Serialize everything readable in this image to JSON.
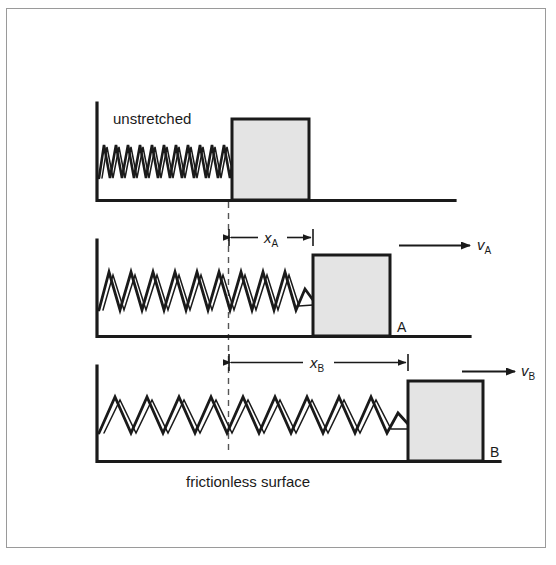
{
  "figure": {
    "kind": "physics-diagram",
    "background_color": "#ffffff",
    "frame_color": "#9a9a9a",
    "ink_color": "#1a1a1a",
    "block_fill_color": "#e4e4e4",
    "block_border_color": "#1a1a1a"
  },
  "labels": {
    "unstretched": "unstretched",
    "frictionless_surface": "frictionless surface",
    "block_a": "A",
    "block_b": "B",
    "x_a_symbol": "x",
    "x_a_subscript": "A",
    "x_b_symbol": "x",
    "x_b_subscript": "B",
    "v_a_symbol": "v",
    "v_a_subscript": "A",
    "v_b_symbol": "v",
    "v_b_subscript": "B"
  },
  "panels": [
    {
      "id": "panel-unstretched",
      "caption": "unstretched",
      "wall_x": 96,
      "ground_y": 202,
      "ground_right_x": 455,
      "spring_coils": 11,
      "spring_left_x": 100,
      "spring_right_x": 232,
      "block_left_x": 232,
      "block_right_x": 309,
      "block_top_y": 119,
      "block_bottom_y": 200,
      "block_label": "",
      "has_velocity_arrow": false,
      "has_dimension": false
    },
    {
      "id": "panel-a",
      "caption": "A",
      "wall_x": 96,
      "ground_y": 338,
      "ground_right_x": 470,
      "spring_coils": 10,
      "spring_left_x": 100,
      "spring_right_x": 313,
      "block_left_x": 313,
      "block_right_x": 390,
      "block_top_y": 255,
      "block_bottom_y": 336,
      "block_label": "A",
      "has_velocity_arrow": true,
      "velocity_arrow_start_x": 400,
      "velocity_arrow_end_x": 470,
      "velocity_arrow_y": 245,
      "has_dimension": true,
      "dim_left_x": 228,
      "dim_right_x": 313,
      "dim_y": 237
    },
    {
      "id": "panel-b",
      "caption": "B",
      "wall_x": 96,
      "ground_y": 463,
      "ground_right_x": 500,
      "spring_coils": 10,
      "spring_left_x": 100,
      "spring_right_x": 408,
      "block_left_x": 408,
      "block_right_x": 483,
      "block_top_y": 381,
      "block_bottom_y": 461,
      "block_label": "B",
      "has_velocity_arrow": true,
      "velocity_arrow_start_x": 463,
      "velocity_arrow_end_x": 515,
      "velocity_arrow_y": 371,
      "has_dimension": true,
      "dim_left_x": 228,
      "dim_right_x": 408,
      "dim_y": 362
    }
  ],
  "reference_line": {
    "name": "unstretched-position-dashed-line",
    "x": 228,
    "top_y": 200,
    "bottom_y": 455,
    "dash_pattern": "6,5"
  }
}
